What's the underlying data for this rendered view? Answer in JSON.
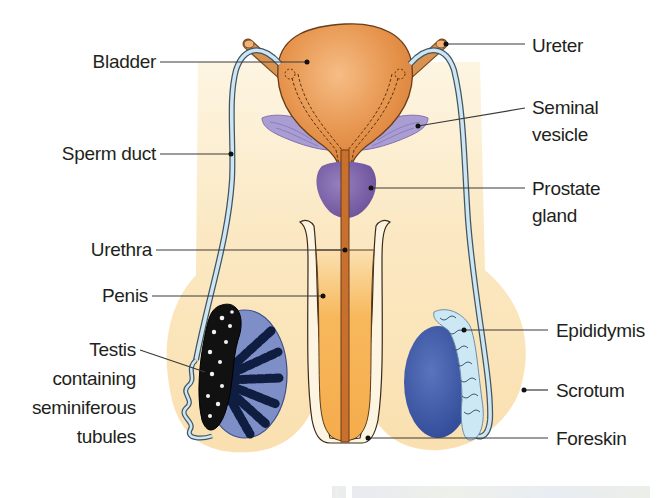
{
  "diagram": {
    "colors": {
      "background": "#ffffff",
      "body_skin": "#fbe6bd",
      "body_skin_light": "#fdf3dc",
      "bladder": "#e2904a",
      "bladder_light": "#f4b57a",
      "ureter": "#d99350",
      "sperm_duct": "#cfe6f2",
      "seminal_vesicle": "#a79bd0",
      "prostate": "#7a5ea6",
      "urethra": "#c9702f",
      "penis": "#f6b256",
      "testis": "#7e8fc8",
      "testis_right": "#3f59a8",
      "epididymis": "#cde8f5",
      "outline": "#3a2a1a"
    },
    "labels": {
      "left": [
        {
          "id": "bladder",
          "text": [
            "Bladder"
          ]
        },
        {
          "id": "sperm_duct",
          "text": [
            "Sperm duct"
          ]
        },
        {
          "id": "urethra",
          "text": [
            "Urethra"
          ]
        },
        {
          "id": "penis",
          "text": [
            "Penis"
          ]
        },
        {
          "id": "testis",
          "text": [
            "Testis",
            "containing",
            "seminiferous",
            "tubules"
          ]
        }
      ],
      "right": [
        {
          "id": "ureter",
          "text": [
            "Ureter"
          ]
        },
        {
          "id": "seminal_vesicle",
          "text": [
            "Seminal",
            "vesicle"
          ]
        },
        {
          "id": "prostate",
          "text": [
            "Prostate",
            "gland"
          ]
        },
        {
          "id": "epididymis",
          "text": [
            "Epididymis"
          ]
        },
        {
          "id": "scrotum",
          "text": [
            "Scrotum"
          ]
        },
        {
          "id": "foreskin",
          "text": [
            "Foreskin"
          ]
        }
      ]
    }
  }
}
